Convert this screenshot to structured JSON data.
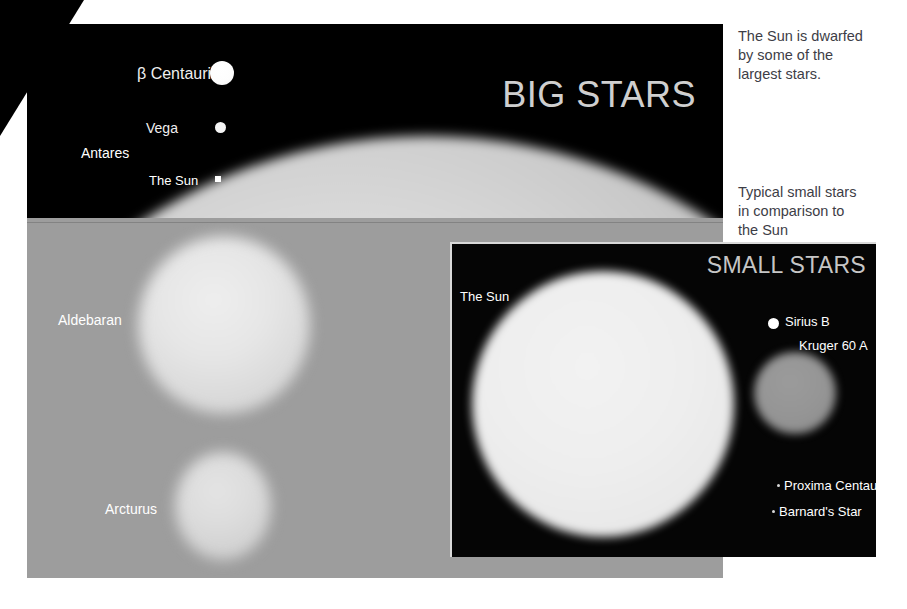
{
  "figure": {
    "title_big": "BIG STARS",
    "title_small": "SMALL STARS"
  },
  "captions": {
    "big": {
      "line1": "The Sun is dwarfed",
      "line2": "by some of the",
      "line3": "largest stars."
    },
    "small": {
      "line1": "Typical small stars",
      "line2": "in comparison to",
      "line3": "the Sun"
    }
  },
  "big_stars": {
    "labels": {
      "beta_centauri": "β Centauri",
      "vega": "Vega",
      "antares": "Antares",
      "the_sun": "The Sun",
      "aldebaran": "Aldebaran",
      "arcturus": "Arcturus"
    }
  },
  "small_stars": {
    "labels": {
      "the_sun": "The Sun",
      "sirius_b": "Sirius B",
      "kruger_60_a": "Kruger 60 A",
      "proxima_centauri": "Proxima Centauri",
      "barnards_star": "Barnard's Star"
    }
  },
  "colors": {
    "panel_background": "#000000",
    "page_background": "#ffffff",
    "title_text": "#cfcfcf",
    "label_text": "#ffffff",
    "caption_text": "#3d3d46",
    "antares_surface": "#9d9d9d",
    "sun_surface": "#eeeeee",
    "kruger_surface": "#959595",
    "sirius_surface": "#ffffff"
  },
  "chart_data": {
    "type": "scatter",
    "xlabel": "",
    "ylabel": "",
    "panels": [
      {
        "name": "BIG STARS",
        "caption": "The Sun is dwarfed by some of the largest stars.",
        "objects": [
          {
            "label": "β Centauri",
            "rendered_diameter_px": 24,
            "color": "#ffffff"
          },
          {
            "label": "Vega",
            "rendered_diameter_px": 11,
            "color": "#f4f4f4"
          },
          {
            "label": "Antares",
            "rendered_diameter_px": 1040,
            "color": "#9d9d9d"
          },
          {
            "label": "The Sun",
            "rendered_diameter_px": 6,
            "color": "#ffffff"
          },
          {
            "label": "Aldebaran",
            "rendered_diameter_px": 175,
            "color": "#e0e0e0"
          },
          {
            "label": "Arcturus",
            "rendered_diameter_px": 102,
            "color": "#d4d4d4"
          }
        ]
      },
      {
        "name": "SMALL STARS",
        "caption": "Typical small stars in comparison to the Sun",
        "objects": [
          {
            "label": "The Sun",
            "rendered_diameter_px": 264,
            "color": "#eeeeee"
          },
          {
            "label": "Sirius B",
            "rendered_diameter_px": 11,
            "color": "#ffffff"
          },
          {
            "label": "Kruger 60 A",
            "rendered_diameter_px": 82,
            "color": "#959595"
          },
          {
            "label": "Proxima Centauri",
            "rendered_diameter_px": 3,
            "color": "#d8d8d8"
          },
          {
            "label": "Barnard's Star",
            "rendered_diameter_px": 3,
            "color": "#d8d8d8"
          }
        ]
      }
    ]
  }
}
